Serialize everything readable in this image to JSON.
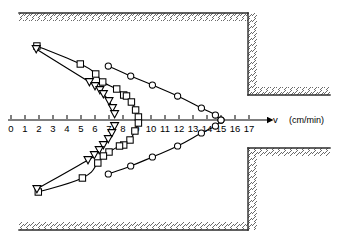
{
  "figure": {
    "background_color": "#ffffff",
    "line_color": "#000000",
    "marker_fill": "#ffffff",
    "hatch_color": "#555555",
    "wall_color": "#333333"
  },
  "axis": {
    "name": "velocity-axis",
    "symbol": "v",
    "unit_label": "(cm/min)",
    "ticks": [
      {
        "value": 0,
        "label": "0"
      },
      {
        "value": 1,
        "label": "1"
      },
      {
        "value": 2,
        "label": "2"
      },
      {
        "value": 3,
        "label": "3"
      },
      {
        "value": 4,
        "label": "4"
      },
      {
        "value": 5,
        "label": "5"
      },
      {
        "value": 6,
        "label": "6"
      },
      {
        "value": 7,
        "label": "7"
      },
      {
        "value": 8,
        "label": "8"
      },
      {
        "value": 9,
        "label": "9"
      },
      {
        "value": 10,
        "label": "10"
      },
      {
        "value": 11,
        "label": "11"
      },
      {
        "value": 12,
        "label": "12"
      },
      {
        "value": 13,
        "label": "13"
      },
      {
        "value": 14,
        "label": "14"
      },
      {
        "value": 15,
        "label": "15"
      },
      {
        "value": 16,
        "label": "16"
      },
      {
        "value": 17,
        "label": "17"
      }
    ],
    "range": [
      0,
      17
    ],
    "origin_px": 11,
    "px_per_unit": 14,
    "baseline_y_px": 120
  },
  "chart_data": {
    "type": "line",
    "title": "",
    "xlabel": "v (cm/min)",
    "ylabel": "",
    "xlim": [
      0,
      17
    ],
    "grid": false,
    "legend": "none",
    "series": [
      {
        "name": "circle-series-upper",
        "marker": "circle",
        "points": [
          {
            "x": 6.95,
            "y": 66
          },
          {
            "x": 8.55,
            "y": 76
          },
          {
            "x": 10.1,
            "y": 85
          },
          {
            "x": 11.9,
            "y": 96
          },
          {
            "x": 13.6,
            "y": 108
          },
          {
            "x": 14.6,
            "y": 115
          },
          {
            "x": 15.0,
            "y": 120
          }
        ]
      },
      {
        "name": "circle-series-lower",
        "marker": "circle",
        "points": [
          {
            "x": 6.95,
            "y": 174
          },
          {
            "x": 8.55,
            "y": 166
          },
          {
            "x": 10.1,
            "y": 157
          },
          {
            "x": 11.9,
            "y": 146
          },
          {
            "x": 13.6,
            "y": 133
          },
          {
            "x": 14.6,
            "y": 126
          },
          {
            "x": 15.0,
            "y": 120
          }
        ]
      },
      {
        "name": "square-series-upper",
        "marker": "square",
        "points": [
          {
            "x": 1.85,
            "y": 46
          },
          {
            "x": 4.95,
            "y": 64
          },
          {
            "x": 6.05,
            "y": 74
          },
          {
            "x": 6.55,
            "y": 82
          },
          {
            "x": 7.55,
            "y": 89
          },
          {
            "x": 8.05,
            "y": 95
          },
          {
            "x": 8.25,
            "y": 96
          },
          {
            "x": 8.6,
            "y": 102
          },
          {
            "x": 8.9,
            "y": 110
          },
          {
            "x": 9.1,
            "y": 117
          }
        ]
      },
      {
        "name": "square-series-lower",
        "marker": "square",
        "points": [
          {
            "x": 9.1,
            "y": 123
          },
          {
            "x": 8.85,
            "y": 131
          },
          {
            "x": 8.5,
            "y": 140
          },
          {
            "x": 8.05,
            "y": 145
          },
          {
            "x": 7.75,
            "y": 146
          },
          {
            "x": 7.0,
            "y": 152
          },
          {
            "x": 6.6,
            "y": 156
          },
          {
            "x": 6.2,
            "y": 163
          },
          {
            "x": 5.1,
            "y": 178
          },
          {
            "x": 1.95,
            "y": 192
          }
        ]
      },
      {
        "name": "triangle-series-upper",
        "marker": "triangle-down",
        "points": [
          {
            "x": 1.8,
            "y": 49
          },
          {
            "x": 5.6,
            "y": 82
          },
          {
            "x": 6.0,
            "y": 86
          },
          {
            "x": 6.35,
            "y": 90
          },
          {
            "x": 6.6,
            "y": 94
          },
          {
            "x": 7.0,
            "y": 101
          },
          {
            "x": 7.25,
            "y": 108
          },
          {
            "x": 7.4,
            "y": 114
          }
        ]
      },
      {
        "name": "triangle-series-lower",
        "marker": "triangle-down",
        "points": [
          {
            "x": 7.4,
            "y": 126
          },
          {
            "x": 7.2,
            "y": 133
          },
          {
            "x": 6.95,
            "y": 139
          },
          {
            "x": 6.6,
            "y": 145
          },
          {
            "x": 6.3,
            "y": 150
          },
          {
            "x": 5.95,
            "y": 155
          },
          {
            "x": 5.5,
            "y": 160
          },
          {
            "x": 1.85,
            "y": 189
          }
        ]
      }
    ]
  },
  "geometry": {
    "top_wall": {
      "name": "top-wall",
      "y": 13,
      "x_start": 19,
      "x_end": 248
    },
    "bottom_wall": {
      "name": "bottom-wall",
      "y": 230,
      "x_start": 19,
      "x_end": 248
    },
    "right_upper_wall": {
      "name": "right-upper-wall",
      "x": 248,
      "y_top": 13,
      "y_bottom": 95
    },
    "right_lower_wall": {
      "name": "right-lower-wall",
      "x": 248,
      "y_top": 148,
      "y_bottom": 230
    },
    "upper_shelf": {
      "name": "upper-shelf",
      "y": 95,
      "x_start": 248,
      "x_end": 330
    },
    "lower_shelf": {
      "name": "lower-shelf",
      "y": 148,
      "x_start": 248,
      "x_end": 330
    }
  }
}
